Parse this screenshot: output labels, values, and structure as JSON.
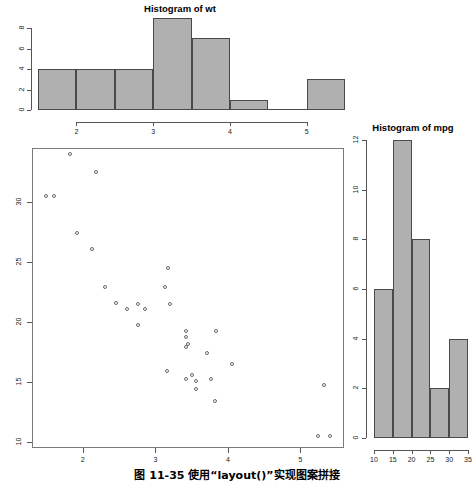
{
  "figure": {
    "caption": "图 11-35    使用“layout()”实现图案拼接",
    "background": "#ffffff",
    "bar_fill": "#b0b0b0",
    "bar_border": "#4a4a4a",
    "point_color": "#6b6b6b",
    "axis_color": "#555555"
  },
  "chart_data": [
    {
      "id": "hist-wt",
      "type": "bar",
      "title": "Histogram of wt",
      "xlabel": "",
      "ylabel": "",
      "categories": [
        "1.5-2",
        "2-2.5",
        "2.5-3",
        "3-3.5",
        "3.5-4",
        "4-4.5",
        "4.5-5",
        "5-5.5"
      ],
      "bin_edges": [
        1.5,
        2,
        2.5,
        3,
        3.5,
        4,
        4.5,
        5,
        5.5
      ],
      "values": [
        4,
        4,
        4,
        9,
        7,
        1,
        0,
        3
      ],
      "xticks": [
        2,
        3,
        4,
        5
      ],
      "xticklabels": [
        "2",
        "3",
        "4",
        "5"
      ],
      "yticks": [
        0,
        2,
        4,
        6,
        8
      ],
      "yticklabels": [
        "0",
        "2",
        "4",
        "6",
        "8"
      ],
      "xlim": [
        1.5,
        5.5
      ],
      "ylim": [
        0,
        9
      ],
      "grid": false,
      "legend": "none"
    },
    {
      "id": "scatter-mpg-wt",
      "type": "scatter",
      "title": "",
      "xlabel": "",
      "ylabel": "",
      "xticks": [
        2,
        3,
        4,
        5
      ],
      "xticklabels": [
        "2",
        "3",
        "4",
        "5"
      ],
      "yticks": [
        10,
        15,
        20,
        25,
        30
      ],
      "yticklabels": [
        "10",
        "15",
        "20",
        "25",
        "30"
      ],
      "xlim": [
        1.3,
        5.6
      ],
      "ylim": [
        9.5,
        34.5
      ],
      "grid": false,
      "legend": "none",
      "points": [
        [
          2.62,
          21.0
        ],
        [
          2.875,
          21.0
        ],
        [
          2.32,
          22.8
        ],
        [
          3.215,
          21.4
        ],
        [
          3.44,
          18.7
        ],
        [
          3.46,
          18.1
        ],
        [
          3.57,
          14.3
        ],
        [
          3.19,
          24.4
        ],
        [
          3.15,
          22.8
        ],
        [
          3.44,
          19.2
        ],
        [
          3.44,
          17.8
        ],
        [
          4.07,
          16.4
        ],
        [
          3.73,
          17.3
        ],
        [
          3.78,
          15.2
        ],
        [
          5.25,
          10.4
        ],
        [
          5.424,
          10.4
        ],
        [
          5.345,
          14.7
        ],
        [
          2.2,
          32.4
        ],
        [
          1.615,
          30.4
        ],
        [
          1.835,
          33.9
        ],
        [
          2.465,
          21.5
        ],
        [
          3.52,
          15.5
        ],
        [
          3.435,
          15.2
        ],
        [
          3.84,
          13.3
        ],
        [
          3.845,
          19.2
        ],
        [
          1.935,
          27.3
        ],
        [
          2.14,
          26.0
        ],
        [
          1.513,
          30.4
        ],
        [
          3.17,
          15.8
        ],
        [
          2.77,
          19.7
        ],
        [
          3.57,
          15.0
        ],
        [
          2.78,
          21.4
        ]
      ]
    },
    {
      "id": "hist-mpg",
      "type": "bar",
      "title": "Histogram of mpg",
      "xlabel": "",
      "ylabel": "",
      "categories": [
        "10-15",
        "15-20",
        "20-25",
        "25-30",
        "30-35"
      ],
      "bin_edges": [
        10,
        15,
        20,
        25,
        30,
        35
      ],
      "values": [
        6,
        12,
        8,
        2,
        4
      ],
      "xticks": [
        10,
        15,
        20,
        25,
        30,
        35
      ],
      "xticklabels": [
        "10",
        "15",
        "20",
        "25",
        "30",
        "35"
      ],
      "yticks": [
        0,
        2,
        4,
        6,
        8,
        10,
        12
      ],
      "yticklabels": [
        "0",
        "2",
        "4",
        "6",
        "8",
        "10",
        "12"
      ],
      "xlim": [
        10,
        35
      ],
      "ylim": [
        0,
        12
      ],
      "grid": false,
      "legend": "none"
    }
  ]
}
